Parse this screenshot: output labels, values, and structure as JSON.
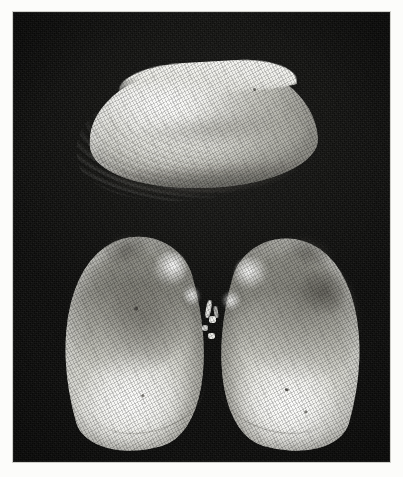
{
  "page": {
    "kind": "photographic-plate",
    "medium": "halftone black-and-white photograph",
    "border_color": "#fcfcfa",
    "caption": ""
  },
  "plate": {
    "background_color": "#101010",
    "highlight_color": "#f2f2ee",
    "midtone_color": "#c9c9c1",
    "shadow_color": "#92928a",
    "subject": "three bivalve mollusc shells",
    "specimens": [
      {
        "id": "top",
        "label": "exterior view of closed valve",
        "orientation": "horizontal, umbo to the right, ventral margin down",
        "features": [
          "concentric growth lines",
          "glossy dorsal highlight",
          "straight dorsal margin"
        ]
      },
      {
        "id": "bottom-left",
        "label": "interior view of left valve",
        "orientation": "tilted, umbo at upper right, ventral margin at lower left",
        "features": [
          "hinge highlight",
          "muscle scar shading",
          "pallial line"
        ]
      },
      {
        "id": "bottom-right",
        "label": "interior view of right valve",
        "orientation": "tilted, umbo at upper left, ventral margin at lower right",
        "features": [
          "hinge highlight",
          "dark muscle scar pocket",
          "pallial line"
        ]
      }
    ],
    "hinge_note": "the two lower valves meet at a bright hinge contact near the centre"
  }
}
